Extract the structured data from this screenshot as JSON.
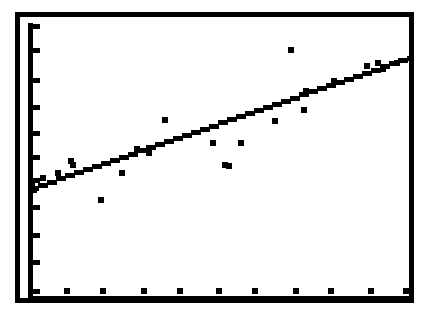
{
  "figure": {
    "name": "scatter-plot-with-regression-line",
    "background_color": "#ffffff",
    "ink_color": "#000000",
    "width": 426,
    "height": 325
  },
  "frame": {
    "outer": {
      "x": 15,
      "y": 12,
      "width": 398,
      "height": 290,
      "stroke_width": 4
    },
    "inner": {
      "x": 25,
      "y": 22,
      "width": 380,
      "height": 272,
      "stroke_width": 0
    }
  },
  "axes": {
    "y_axis": {
      "x": 28,
      "y_top": 24,
      "y_bottom": 294,
      "stroke_width": 4,
      "tick_length": 9,
      "tick_width": 5,
      "tick_positions": [
        26,
        50,
        80,
        107,
        133,
        157,
        180,
        207,
        235,
        262,
        290
      ],
      "tick_count": 11
    },
    "x_axis": {
      "y": 298,
      "x_left": 28,
      "x_right": 410,
      "stroke_width": 4
    }
  },
  "chart_data": {
    "type": "scatter",
    "title": "",
    "subtitle": "",
    "xlabel": "",
    "ylabel": "",
    "xlim": [
      0,
      100
    ],
    "ylim": [
      0,
      100
    ],
    "grid": false,
    "legend": null,
    "axis_tick_labels": {
      "x": [],
      "y": []
    },
    "point_marker": {
      "shape": "square",
      "size_px": 6,
      "color": "#000000"
    },
    "points_px": [
      {
        "x": 43,
        "y": 178
      },
      {
        "x": 32,
        "y": 186
      },
      {
        "x": 58,
        "y": 173
      },
      {
        "x": 71,
        "y": 161
      },
      {
        "x": 73,
        "y": 165
      },
      {
        "x": 34,
        "y": 190
      },
      {
        "x": 101,
        "y": 200
      },
      {
        "x": 122,
        "y": 173
      },
      {
        "x": 137,
        "y": 149
      },
      {
        "x": 165,
        "y": 120
      },
      {
        "x": 149,
        "y": 153
      },
      {
        "x": 213,
        "y": 143
      },
      {
        "x": 225,
        "y": 165
      },
      {
        "x": 241,
        "y": 143
      },
      {
        "x": 229,
        "y": 166
      },
      {
        "x": 275,
        "y": 121
      },
      {
        "x": 291,
        "y": 50
      },
      {
        "x": 304,
        "y": 110
      },
      {
        "x": 306,
        "y": 91
      },
      {
        "x": 334,
        "y": 81
      },
      {
        "x": 367,
        "y": 66
      },
      {
        "x": 378,
        "y": 63
      },
      {
        "x": 383,
        "y": 69
      },
      {
        "x": 397,
        "y": 63
      }
    ],
    "x_axis_markers_px": [
      {
        "x": 67,
        "y": 291
      },
      {
        "x": 103,
        "y": 291
      },
      {
        "x": 144,
        "y": 291
      },
      {
        "x": 180,
        "y": 291
      },
      {
        "x": 219,
        "y": 291
      },
      {
        "x": 255,
        "y": 291
      },
      {
        "x": 296,
        "y": 291
      },
      {
        "x": 331,
        "y": 291
      },
      {
        "x": 371,
        "y": 291
      },
      {
        "x": 406,
        "y": 291
      }
    ],
    "fit_line": {
      "style": "solid-staircase",
      "thickness_px": 5,
      "start_px": {
        "x": 29,
        "y": 190
      },
      "end_px": {
        "x": 411,
        "y": 58
      },
      "description": "positively sloped least-squares regression line"
    }
  }
}
